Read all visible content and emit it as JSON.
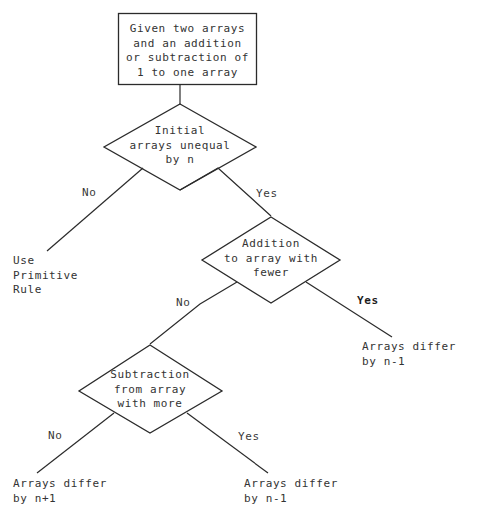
{
  "diagram": {
    "type": "flowchart",
    "start_box": {
      "text": "Given two arrays\nand an addition\nor subtraction of\n1 to one array"
    },
    "decisions": [
      {
        "id": "decision-initial-unequal",
        "text": "Initial\narrays unequal\nby n",
        "no_label": "No",
        "yes_label": "Yes"
      },
      {
        "id": "decision-addition-fewer",
        "text": "Addition\nto array with\nfewer",
        "no_label": "No",
        "yes_label": "Yes"
      },
      {
        "id": "decision-subtraction-more",
        "text": "Subtraction\nfrom array\nwith more",
        "no_label": "No",
        "yes_label": "Yes"
      }
    ],
    "outcomes": [
      {
        "id": "outcome-primitive-rule",
        "text": "Use\nPrimitive\nRule"
      },
      {
        "id": "outcome-differ-n-minus-1-right",
        "text": "Arrays differ\nby n-1"
      },
      {
        "id": "outcome-differ-n-plus-1",
        "text": "Arrays differ\nby n+1"
      },
      {
        "id": "outcome-differ-n-minus-1-bottom",
        "text": "Arrays differ\nby n-1"
      }
    ],
    "colors": {
      "background": "#ffffff",
      "stroke": "#2b2b2b",
      "text": "#333333"
    }
  }
}
